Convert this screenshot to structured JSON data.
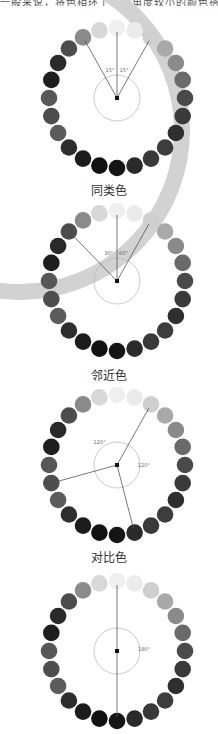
{
  "top_text": "一般来说，将色相环上间隔角度较小的颜色搭配在一起",
  "wheels": [
    {
      "id": "same-type",
      "caption": "同类色",
      "angles_label": [
        "15°",
        "15°"
      ],
      "lines_deg": [
        -30,
        0,
        30
      ],
      "arc_labels": [
        {
          "text": "15°",
          "deg": -15
        },
        {
          "text": "15°",
          "deg": 15
        }
      ]
    },
    {
      "id": "adjacent",
      "caption": "邻近色",
      "lines_deg": [
        -45,
        0,
        30
      ],
      "arc_labels": [
        {
          "text": "30°",
          "deg": -18
        },
        {
          "text": "60°",
          "deg": 14
        }
      ]
    },
    {
      "id": "contrast",
      "caption": "对比色",
      "lines_deg": [
        30,
        165,
        255
      ],
      "arc_labels": [
        {
          "text": "120°",
          "deg": -40
        },
        {
          "text": "120°",
          "deg": 95
        }
      ]
    },
    {
      "id": "complementary",
      "caption": "",
      "lines_deg": [
        0,
        180
      ],
      "arc_labels": [
        {
          "text": "180°",
          "deg": 90
        }
      ]
    }
  ],
  "dot_colors": [
    "#efefef",
    "#ebebeb",
    "#cfcfcf",
    "#a9a9a9",
    "#8a8a8a",
    "#6a6a6a",
    "#4a4a4a",
    "#3a3a3a",
    "#2f2f2f",
    "#3d3d3d",
    "#393939",
    "#2a2a2a",
    "#151515",
    "#121212",
    "#1c1c1c",
    "#2e2e2e",
    "#5c5c5c",
    "#4e4e4e",
    "#575757",
    "#1e1e1e",
    "#2a2a2a",
    "#4c4c4c",
    "#8a8a8a",
    "#d8d8d8"
  ]
}
